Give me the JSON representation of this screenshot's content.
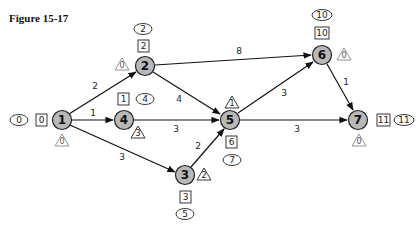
{
  "title": "Figure 15-17",
  "nodes": {
    "n1": {
      "label": "1",
      "es": "0",
      "ef": "0",
      "slack": "0"
    },
    "n2": {
      "label": "2",
      "es": "2",
      "ef": "2",
      "slack": "0"
    },
    "n3": {
      "label": "3",
      "es": "3",
      "ef": "5",
      "slack": "2"
    },
    "n4": {
      "label": "4",
      "es": "1",
      "ef": "4",
      "slack": "3"
    },
    "n5": {
      "label": "5",
      "es": "6",
      "ef": "7",
      "slack": "1"
    },
    "n6": {
      "label": "6",
      "es": "10",
      "ef": "10",
      "slack": "0"
    },
    "n7": {
      "label": "7",
      "es": "11",
      "ef": "11",
      "slack": "0"
    }
  },
  "edges": {
    "e12": {
      "from": "1",
      "to": "2",
      "weight": "2"
    },
    "e14": {
      "from": "1",
      "to": "4",
      "weight": "1"
    },
    "e13": {
      "from": "1",
      "to": "3",
      "weight": "3"
    },
    "e26": {
      "from": "2",
      "to": "6",
      "weight": "8"
    },
    "e25": {
      "from": "2",
      "to": "5",
      "weight": "4"
    },
    "e45": {
      "from": "4",
      "to": "5",
      "weight": "3"
    },
    "e35": {
      "from": "3",
      "to": "5",
      "weight": "2"
    },
    "e56": {
      "from": "5",
      "to": "6",
      "weight": "3"
    },
    "e57": {
      "from": "5",
      "to": "7",
      "weight": "3"
    },
    "e67": {
      "from": "6",
      "to": "7",
      "weight": "1"
    }
  },
  "legend_shapes": {
    "square": "earliest time",
    "ellipse": "latest time",
    "triangle": "slack"
  }
}
